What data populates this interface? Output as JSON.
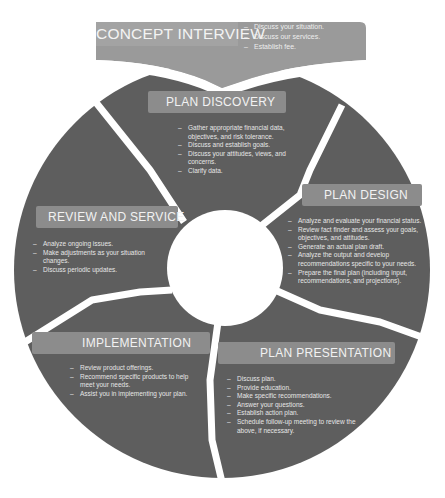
{
  "colors": {
    "wheel": "#5e5e5e",
    "banner": "#9a9a9a",
    "label_bar": "#8c8c8c",
    "separator": "#ffffff",
    "text": "#eeeeee"
  },
  "banner": {
    "title": "CONCEPT INTERVIEW",
    "items": [
      "Discuss your situation.",
      "Discuss our services.",
      "Establish fee."
    ]
  },
  "segments": {
    "plan_discovery": {
      "title": "PLAN DISCOVERY",
      "items": [
        "Gather appropriate financial data, objectives, and risk tolerance.",
        "Discuss and establish goals.",
        "Discuss your attitudes, views, and concerns.",
        "Clarify data."
      ]
    },
    "plan_design": {
      "title": "PLAN DESIGN",
      "items": [
        "Analyze and evaluate your financial status.",
        "Review fact finder and assess your goals, objectives, and attitudes.",
        "Generate an actual plan draft.",
        "Analyze the output and develop recommendations specific to your needs.",
        "Prepare the final plan (including input, recommendations, and projections)."
      ]
    },
    "plan_presentation": {
      "title": "PLAN PRESENTATION",
      "items": [
        "Discuss plan.",
        "Provide education.",
        "Make specific recommendations.",
        "Answer your questions.",
        "Establish action plan.",
        "Schedule follow-up meeting to review the above, if necessary."
      ]
    },
    "implementation": {
      "title": "IMPLEMENTATION",
      "items": [
        "Review product offerings.",
        "Recommend specific products to help meet your needs.",
        "Assist you in implementing your plan."
      ]
    },
    "review_and_service": {
      "title": "REVIEW AND SERVICE",
      "items": [
        "Analyze ongoing issues.",
        "Make adjustments as your situation changes.",
        "Discuss periodic updates."
      ]
    }
  }
}
